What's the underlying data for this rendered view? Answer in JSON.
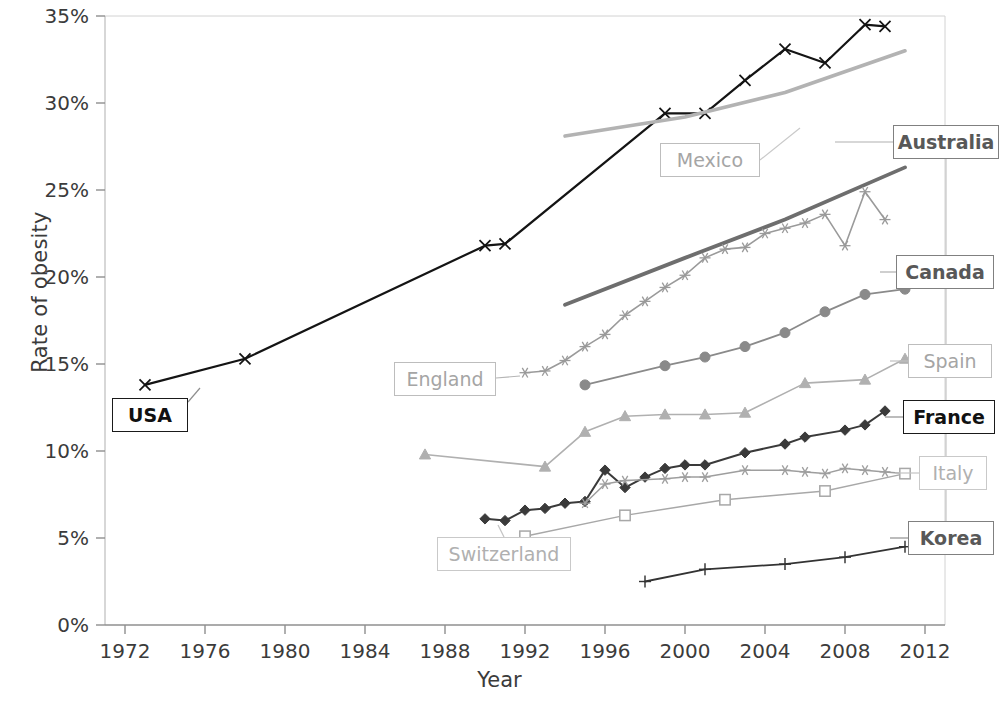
{
  "chart_data": {
    "type": "line",
    "title": "",
    "xlabel": "Year",
    "ylabel": "Rate of obesity",
    "xlim": [
      1971,
      2013
    ],
    "ylim": [
      0,
      35
    ],
    "ytick_labels": [
      "0%",
      "5%",
      "10%",
      "15%",
      "20%",
      "25%",
      "30%",
      "35%"
    ],
    "ytick_values": [
      0,
      5,
      10,
      15,
      20,
      25,
      30,
      35
    ],
    "xtick_labels": [
      "1972",
      "1976",
      "1980",
      "1984",
      "1988",
      "1992",
      "1996",
      "2000",
      "2004",
      "2008",
      "2012"
    ],
    "xtick_values": [
      1972,
      1976,
      1980,
      1984,
      1988,
      1992,
      1996,
      2000,
      2004,
      2008,
      2012
    ],
    "grid": false,
    "legend_position": "inline-callouts",
    "series": [
      {
        "name": "USA",
        "color": "#141414",
        "width": 2.2,
        "marker": "x",
        "x": [
          1973,
          1978,
          1990,
          1991,
          1999,
          2001,
          2003,
          2005,
          2007,
          2009,
          2010
        ],
        "values": [
          13.8,
          15.3,
          21.8,
          21.9,
          29.4,
          29.4,
          31.3,
          33.1,
          32.3,
          34.5,
          34.4
        ]
      },
      {
        "name": "Mexico",
        "color": "#b3b3b3",
        "width": 3.6,
        "marker": "none",
        "x": [
          1994,
          2000,
          2005,
          2011
        ],
        "values": [
          28.1,
          29.2,
          30.6,
          33.0
        ]
      },
      {
        "name": "Australia",
        "color": "#6e6e6e",
        "width": 3.8,
        "marker": "none",
        "x": [
          1994,
          2000,
          2005,
          2011
        ],
        "values": [
          18.4,
          21.1,
          23.3,
          26.3
        ]
      },
      {
        "name": "England",
        "color": "#9a9a9a",
        "width": 1.6,
        "marker": "star",
        "x": [
          1992,
          1993,
          1994,
          1995,
          1996,
          1997,
          1998,
          1999,
          2000,
          2001,
          2002,
          2003,
          2004,
          2005,
          2006,
          2007,
          2008,
          2009,
          2010
        ],
        "values": [
          14.5,
          14.6,
          15.2,
          16.0,
          16.7,
          17.8,
          18.6,
          19.4,
          20.1,
          21.1,
          21.6,
          21.7,
          22.5,
          22.8,
          23.1,
          23.6,
          21.8,
          24.9,
          23.3
        ]
      },
      {
        "name": "Canada",
        "color": "#8a8a8a",
        "width": 1.8,
        "marker": "circle",
        "x": [
          1995,
          1999,
          2001,
          2003,
          2005,
          2007,
          2009,
          2011
        ],
        "values": [
          13.8,
          14.9,
          15.4,
          16.0,
          16.8,
          18.0,
          19.0,
          19.3
        ]
      },
      {
        "name": "Spain",
        "color": "#b0b0b0",
        "width": 1.6,
        "marker": "triangle",
        "x": [
          1987,
          1993,
          1995,
          1997,
          1999,
          2001,
          2003,
          2006,
          2009,
          2011
        ],
        "values": [
          9.8,
          9.1,
          11.1,
          12.0,
          12.1,
          12.1,
          12.2,
          13.9,
          14.1,
          15.3
        ]
      },
      {
        "name": "France",
        "color": "#3a3a3a",
        "width": 2.0,
        "marker": "diamond",
        "x": [
          1990,
          1991,
          1992,
          1993,
          1994,
          1995,
          1996,
          1997,
          1998,
          1999,
          2000,
          2001,
          2003,
          2005,
          2006,
          2008,
          2009,
          2010
        ],
        "values": [
          6.1,
          6.0,
          6.6,
          6.7,
          7.0,
          7.1,
          8.9,
          7.9,
          8.5,
          9.0,
          9.2,
          9.2,
          9.9,
          10.4,
          10.8,
          11.2,
          11.5,
          12.3
        ]
      },
      {
        "name": "Italy",
        "color": "#9e9e9e",
        "width": 1.5,
        "marker": "star",
        "x": [
          1995,
          1996,
          1997,
          1999,
          2000,
          2001,
          2003,
          2005,
          2006,
          2007,
          2008,
          2009,
          2010,
          2011
        ],
        "values": [
          7.0,
          8.1,
          8.3,
          8.4,
          8.5,
          8.5,
          8.9,
          8.9,
          8.8,
          8.7,
          9.0,
          8.9,
          8.8,
          8.7
        ]
      },
      {
        "name": "Switzerland",
        "color": "#a8a8a8",
        "width": 1.5,
        "marker": "square",
        "x": [
          1992,
          1997,
          2002,
          2007,
          2011
        ],
        "values": [
          5.1,
          6.3,
          7.2,
          7.7,
          8.7
        ]
      },
      {
        "name": "Korea",
        "color": "#333333",
        "width": 1.8,
        "marker": "plus",
        "x": [
          1998,
          2001,
          2005,
          2008,
          2011
        ],
        "values": [
          2.5,
          3.2,
          3.5,
          3.9,
          4.5
        ]
      }
    ]
  },
  "callouts": [
    {
      "label": "USA",
      "style": "strong"
    },
    {
      "label": "Mexico",
      "style": "light"
    },
    {
      "label": "England",
      "style": "light"
    },
    {
      "label": "Switzerland",
      "style": "faint"
    },
    {
      "label": "Australia",
      "style": "mid"
    },
    {
      "label": "Canada",
      "style": "mid"
    },
    {
      "label": "Spain",
      "style": "light"
    },
    {
      "label": "France",
      "style": "strong"
    },
    {
      "label": "Italy",
      "style": "faint"
    },
    {
      "label": "Korea",
      "style": "mid"
    }
  ]
}
